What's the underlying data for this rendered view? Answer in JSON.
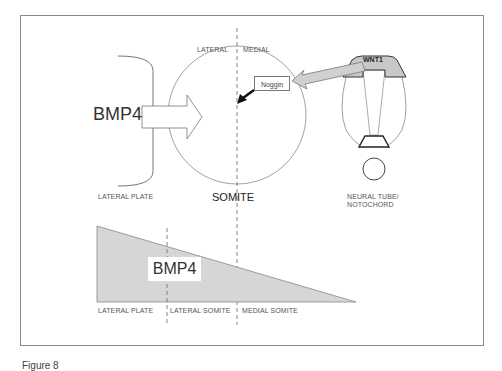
{
  "figure": {
    "caption": "Figure 8",
    "colors": {
      "frame": "#8a8a8a",
      "gradient_fill": "#d6d6d6",
      "wnt_fill": "#c8c8c8",
      "arrow_fill": "#d0d0d0",
      "line": "#777777"
    }
  },
  "upper": {
    "bmp4_label": "BMP4",
    "lateral_label": "LATERAL",
    "medial_label": "MEDIAL",
    "lateral_plate_label": "LATERAL PLATE",
    "somite_label": "SOMITE",
    "noggin_label": "Noggin",
    "wnt1_label": "WNT1",
    "neural_tube_label_line1": "NEURAL TUBE/",
    "neural_tube_label_line2": "NOTOCHORD"
  },
  "lower": {
    "bmp4_label": "BMP4",
    "regions": [
      {
        "label": "LATERAL PLATE"
      },
      {
        "label": "LATERAL SOMITE"
      },
      {
        "label": "MEDIAL SOMITE"
      }
    ]
  }
}
